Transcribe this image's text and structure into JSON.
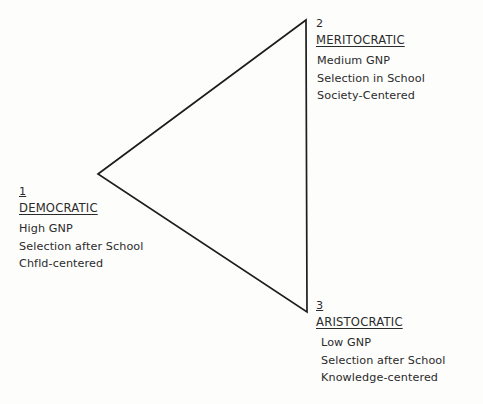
{
  "diagram": {
    "type": "triangle-typology",
    "background_color": "#fdfdfc",
    "line_color": "#1d1d1d",
    "text_color": "#2b2b2b",
    "vertices": {
      "left": {
        "x": 98,
        "y": 174
      },
      "top_right": {
        "x": 306,
        "y": 20
      },
      "bottom_right": {
        "x": 307,
        "y": 312
      }
    },
    "nodes": [
      {
        "number": "1",
        "number_underlined": true,
        "title": "DEMOCRATIC",
        "attributes": [
          "High GNP",
          "Selection after School",
          "Chfld-centered"
        ]
      },
      {
        "number": "2",
        "number_underlined": false,
        "title": "MERITOCRATIC",
        "attributes": [
          "Medium GNP",
          "Selection in School",
          "Society-Centered"
        ]
      },
      {
        "number": "3",
        "number_underlined": true,
        "title": "ARISTOCRATIC",
        "attributes": [
          "Low GNP",
          "Selection after School",
          "Knowledge-centered"
        ]
      }
    ]
  }
}
